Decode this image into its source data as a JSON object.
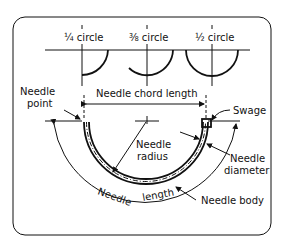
{
  "diagram": {
    "circle_types": [
      {
        "label": "¼ circle"
      },
      {
        "label": "⅜ circle"
      },
      {
        "label": "½ circle"
      }
    ],
    "labels": {
      "needle_point_1": "Needle",
      "needle_point_2": "point",
      "chord_length": "Needle chord length",
      "swage": "Swage",
      "radius_1": "Needle",
      "radius_2": "radius",
      "diameter_1": "Needle",
      "diameter_2": "diameter",
      "length_1": "Needle",
      "length_2": "length",
      "body": "Needle body"
    },
    "colors": {
      "ink": "#111111",
      "background": "#ffffff"
    }
  }
}
